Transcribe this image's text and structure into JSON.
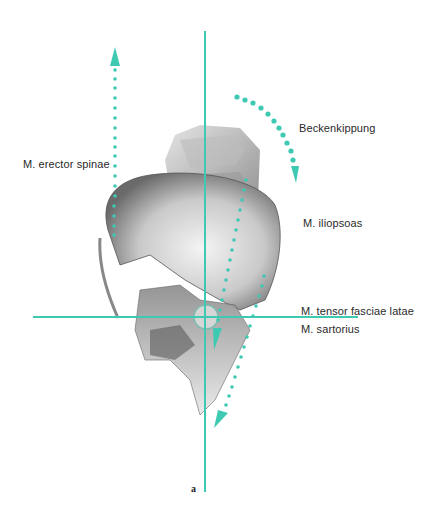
{
  "figure": {
    "letter": "a",
    "accent_color": "#3ec9b3"
  },
  "labels": {
    "erector": "M. erector spinae",
    "beckenkippung": "Beckenkippung",
    "iliopsoas": "M. iliopsoas",
    "tensor": "M. tensor fasciae latae",
    "sartorius": "M. sartorius"
  },
  "axes": {
    "vertical": {
      "x": 205,
      "y1": 31,
      "y2": 492
    },
    "horizontal": {
      "y": 317,
      "x1": 33,
      "x2": 358
    }
  },
  "arrows": [
    {
      "name": "erector-spinae-arrow",
      "direction": "up"
    },
    {
      "name": "beckenkippung-arrow",
      "direction": "curved-down"
    },
    {
      "name": "iliopsoas-arrow",
      "direction": "down"
    },
    {
      "name": "tensor-sartorius-arrow",
      "direction": "down"
    }
  ]
}
